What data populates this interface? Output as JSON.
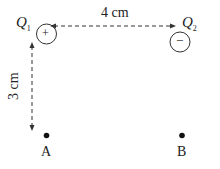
{
  "charges": [
    {
      "name": "Q",
      "subscript": "1",
      "sign": "+"
    },
    {
      "name": "Q",
      "subscript": "2",
      "sign": "−"
    }
  ],
  "distances": {
    "horizontal": "4 cm",
    "vertical": "3 cm"
  },
  "points": [
    {
      "label": "A"
    },
    {
      "label": "B"
    }
  ]
}
